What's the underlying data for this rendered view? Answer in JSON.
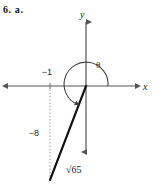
{
  "problem": {
    "label": "6. a."
  },
  "figure": {
    "type": "coordinate-plane-angle-diagram",
    "axes": {
      "x_label": "x",
      "y_label": "y",
      "x_axis_color": "#555555",
      "y_axis_color": "#555555"
    },
    "angle": {
      "symbol": "θ",
      "direction": "counterclockwise",
      "from_axis": "positive-x-axis"
    },
    "points": {
      "x_value": "−1",
      "y_value": "−8",
      "terminal_point": "(−1, −8)"
    },
    "hypotenuse": {
      "radical_sign": "√",
      "radicand": "65",
      "full_label": "√65"
    },
    "colors": {
      "ray": "#111111",
      "axis": "#555555",
      "dotted_guide": "#9a9a9a",
      "text": "#1a1a1a"
    }
  }
}
